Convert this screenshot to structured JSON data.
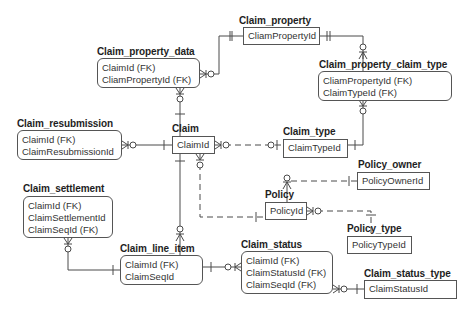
{
  "diagram": {
    "type": "entity-relationship",
    "notation": "crow's foot",
    "entities": [
      {
        "id": "claim_property",
        "name": "Claim_property",
        "attributes": [
          "CliamPropertyId"
        ],
        "dependent": false
      },
      {
        "id": "claim_property_data",
        "name": "Claim_property_data",
        "attributes": [
          "ClaimId (FK)",
          "CliamPropertyId (FK)"
        ],
        "dependent": true
      },
      {
        "id": "claim_property_claim_type",
        "name": "Claim_property_claim_type",
        "attributes": [
          "CliamPropertyId (FK)",
          "ClaimTypeId (FK)"
        ],
        "dependent": true
      },
      {
        "id": "claim_resubmission",
        "name": "Claim_resubmission",
        "attributes": [
          "ClaimId (FK)",
          "ClaimResubmissionId"
        ],
        "dependent": true
      },
      {
        "id": "claim",
        "name": "Claim",
        "attributes": [
          "ClaimId"
        ],
        "dependent": false
      },
      {
        "id": "claim_type",
        "name": "Claim_type",
        "attributes": [
          "ClaimTypeId"
        ],
        "dependent": false
      },
      {
        "id": "policy_owner",
        "name": "Policy_owner",
        "attributes": [
          "PolicyOwnerId"
        ],
        "dependent": false
      },
      {
        "id": "policy",
        "name": "Policy",
        "attributes": [
          "PolicyId"
        ],
        "dependent": false
      },
      {
        "id": "policy_type",
        "name": "Policy_type",
        "attributes": [
          "PolicyTypeId"
        ],
        "dependent": false
      },
      {
        "id": "claim_settlement",
        "name": "Claim_settlement",
        "attributes": [
          "ClaimId (FK)",
          "ClaimSettlementId",
          "ClaimSeqId (FK)"
        ],
        "dependent": true
      },
      {
        "id": "claim_line_item",
        "name": "Claim_line_item",
        "attributes": [
          "ClaimId (FK)",
          "ClaimSeqId"
        ],
        "dependent": true
      },
      {
        "id": "claim_status",
        "name": "Claim_status",
        "attributes": [
          "ClaimId (FK)",
          "ClaimStatusId (FK)",
          "ClaimSeqId (FK)"
        ],
        "dependent": true
      },
      {
        "id": "claim_status_type",
        "name": "Claim_status_type",
        "attributes": [
          "ClaimStatusId"
        ],
        "dependent": false
      }
    ],
    "relationships": [
      {
        "from": "claim_property",
        "to": "claim_property_data",
        "from_card": "one",
        "to_card": "zero-or-many",
        "identifying": true
      },
      {
        "from": "claim_property",
        "to": "claim_property_claim_type",
        "from_card": "one",
        "to_card": "one-or-many",
        "identifying": true
      },
      {
        "from": "claim",
        "to": "claim_property_data",
        "from_card": "one",
        "to_card": "zero-or-many",
        "identifying": true
      },
      {
        "from": "claim",
        "to": "claim_resubmission",
        "from_card": "one",
        "to_card": "zero-or-many",
        "identifying": true
      },
      {
        "from": "claim_type",
        "to": "claim",
        "from_card": "zero-or-one",
        "to_card": "zero-or-many",
        "identifying": false
      },
      {
        "from": "claim_type",
        "to": "claim_property_claim_type",
        "from_card": "one",
        "to_card": "zero-or-many",
        "identifying": true
      },
      {
        "from": "policy",
        "to": "claim",
        "from_card": "one",
        "to_card": "zero-or-many",
        "identifying": false
      },
      {
        "from": "policy_owner",
        "to": "policy",
        "from_card": "one",
        "to_card": "one-or-many",
        "identifying": false
      },
      {
        "from": "policy_type",
        "to": "policy",
        "from_card": "one",
        "to_card": "zero-or-many",
        "identifying": false
      },
      {
        "from": "claim",
        "to": "claim_line_item",
        "from_card": "one",
        "to_card": "one-or-many",
        "identifying": true
      },
      {
        "from": "claim_line_item",
        "to": "claim_settlement",
        "from_card": "one",
        "to_card": "zero-or-many",
        "identifying": true
      },
      {
        "from": "claim_line_item",
        "to": "claim_status",
        "from_card": "one",
        "to_card": "zero-or-many",
        "identifying": true
      },
      {
        "from": "claim_status_type",
        "to": "claim_status",
        "from_card": "one",
        "to_card": "zero-or-many",
        "identifying": true
      }
    ]
  },
  "entities": {
    "claim_property": {
      "name": "Claim_property",
      "attrs": [
        "CliamPropertyId"
      ]
    },
    "claim_property_data": {
      "name": "Claim_property_data",
      "attrs": [
        "ClaimId (FK)",
        "CliamPropertyId (FK)"
      ]
    },
    "claim_property_claim_type": {
      "name": "Claim_property_claim_type",
      "attrs": [
        "CliamPropertyId (FK)",
        "ClaimTypeId (FK)"
      ]
    },
    "claim_resubmission": {
      "name": "Claim_resubmission",
      "attrs": [
        "ClaimId (FK)",
        "ClaimResubmissionId"
      ]
    },
    "claim": {
      "name": "Claim",
      "attrs": [
        "ClaimId"
      ]
    },
    "claim_type": {
      "name": "Claim_type",
      "attrs": [
        "ClaimTypeId"
      ]
    },
    "policy_owner": {
      "name": "Policy_owner",
      "attrs": [
        "PolicyOwnerId"
      ]
    },
    "policy": {
      "name": "Policy",
      "attrs": [
        "PolicyId"
      ]
    },
    "policy_type": {
      "name": "Policy_type",
      "attrs": [
        "PolicyTypeId"
      ]
    },
    "claim_settlement": {
      "name": "Claim_settlement",
      "attrs": [
        "ClaimId (FK)",
        "ClaimSettlementId",
        "ClaimSeqId (FK)"
      ]
    },
    "claim_line_item": {
      "name": "Claim_line_item",
      "attrs": [
        "ClaimId (FK)",
        "ClaimSeqId"
      ]
    },
    "claim_status": {
      "name": "Claim_status",
      "attrs": [
        "ClaimId (FK)",
        "ClaimStatusId (FK)",
        "ClaimSeqId (FK)"
      ]
    },
    "claim_status_type": {
      "name": "Claim_status_type",
      "attrs": [
        "ClaimStatusId"
      ]
    }
  },
  "colors": {
    "line": "#4a4a4a",
    "text": "#2a2a2a",
    "background": "#ffffff"
  }
}
